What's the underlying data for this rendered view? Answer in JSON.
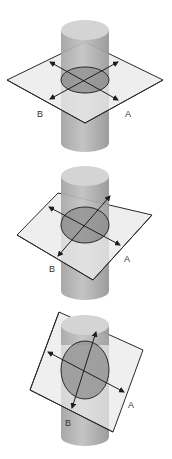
{
  "figures": [
    {
      "id": "horizontal-section",
      "label_b": "B",
      "label_a": "A"
    },
    {
      "id": "tilted-section",
      "label_b": "B",
      "label_a": "A"
    },
    {
      "id": "steep-section",
      "label_b": "B",
      "label_a": "A"
    }
  ],
  "colors": {
    "cylinder_body": "#b4b4b4",
    "cylinder_top": "#d2d2d2",
    "plane_fill": "#e6e6e6",
    "section_fill": "#8c8c8c",
    "stroke": "#2a2a2a"
  }
}
